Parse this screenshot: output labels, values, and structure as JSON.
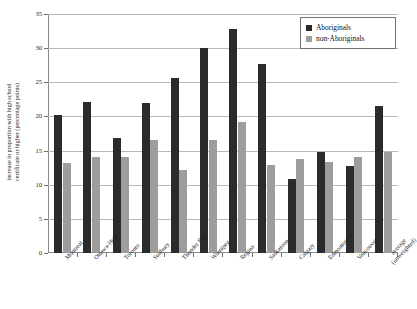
{
  "chart_data": {
    "type": "bar",
    "title": "",
    "xlabel": "",
    "ylabel": "increase in proportion with high school certificate or higher (percentage points)",
    "ylabel_lines": [
      "increase in proportion with high school",
      "certificate or higher (percentage points)"
    ],
    "ylim": [
      0,
      35
    ],
    "yticks": [
      0,
      5,
      10,
      15,
      20,
      25,
      30,
      35
    ],
    "ytick_labels": [
      "0",
      "5",
      "10",
      "15",
      "20",
      "25",
      "30",
      "35"
    ],
    "grid": true,
    "legend_position": "top-right",
    "categories": [
      "Montreal",
      "Ottawa-Hull",
      "Toronto",
      "Sudbury",
      "Thunder Bay",
      "Winnipeg",
      "Regina",
      "Saskatoon",
      "Calgary",
      "Edmonton",
      "Vancouver",
      "average (unweighted)"
    ],
    "category_lines": [
      [
        "Montreal"
      ],
      [
        "Ottawa-Hull"
      ],
      [
        "Toronto"
      ],
      [
        "Sudbury"
      ],
      [
        "Thunder Bay"
      ],
      [
        "Winnipeg"
      ],
      [
        "Regina"
      ],
      [
        "Saskatoon"
      ],
      [
        "Calgary"
      ],
      [
        "Edmonton"
      ],
      [
        "Vancouver"
      ],
      [
        "average",
        "(unweighted)"
      ]
    ],
    "series": [
      {
        "name": "Aboriginals",
        "color": "#2b2b2b",
        "values": [
          20.2,
          22.1,
          16.9,
          21.9,
          25.6,
          30.0,
          32.8,
          27.7,
          10.9,
          14.8,
          12.7,
          21.6
        ]
      },
      {
        "name": "non-Aboriginals",
        "color": "#9d9d9d",
        "values": [
          13.2,
          14.0,
          14.1,
          16.6,
          12.2,
          16.6,
          19.2,
          12.9,
          13.8,
          13.3,
          14.1,
          14.8
        ]
      }
    ]
  },
  "legend": {
    "items": [
      {
        "label": "Aboriginals",
        "color": "#2b2b2b"
      },
      {
        "label": "non-Aboriginals",
        "color": "#9d9d9d"
      }
    ]
  }
}
